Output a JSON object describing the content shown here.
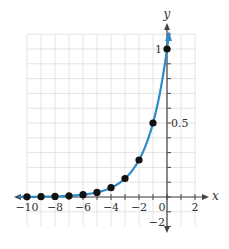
{
  "chart_data": {
    "type": "line",
    "title": "",
    "function": "y = 2^x",
    "xlabel": "x",
    "ylabel": "y",
    "xlim": [
      -10,
      2
    ],
    "ylim": [
      -0.2,
      1.1
    ],
    "grid": true,
    "x_ticks": [
      -10,
      -8,
      -6,
      -4,
      -2,
      0,
      2
    ],
    "x_tick_labels": [
      "−10",
      "−8",
      "−6",
      "−4",
      "−2",
      "0",
      "2"
    ],
    "y_tick_labels": [
      {
        "value": 1,
        "label": "1"
      },
      {
        "value": 0.5,
        "label": "0.5"
      },
      {
        "value": -0.2,
        "label": "−2"
      }
    ],
    "points": {
      "x": [
        -10,
        -9,
        -8,
        -7,
        -6,
        -5,
        -4,
        -3,
        -2,
        -1,
        0
      ],
      "y": [
        0.001,
        0.002,
        0.004,
        0.008,
        0.016,
        0.031,
        0.063,
        0.125,
        0.25,
        0.5,
        1
      ]
    },
    "series": [
      {
        "name": "curve",
        "color": "#2e8bc9"
      },
      {
        "name": "plotted points",
        "color": "#111111"
      }
    ]
  },
  "colors": {
    "curve": "#2e8bc9",
    "points": "#111111",
    "axis": "#444444",
    "grid": "#e4e4e4"
  }
}
